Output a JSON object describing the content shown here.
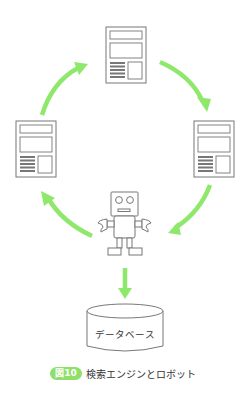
{
  "colors": {
    "arrow": "#8ee86b",
    "stroke": "#777777",
    "badge_bg": "#8ee06b",
    "text": "#333333"
  },
  "nodes": {
    "pages": [
      {
        "id": "page-top",
        "label": "Web page (top)"
      },
      {
        "id": "page-right",
        "label": "Web page (right)"
      },
      {
        "id": "page-left",
        "label": "Web page (left)"
      }
    ],
    "robot": {
      "label": "crawler robot"
    },
    "database": {
      "label": "データベース"
    }
  },
  "edges": [
    {
      "from": "page-top",
      "to": "page-right"
    },
    {
      "from": "page-right",
      "to": "robot"
    },
    {
      "from": "robot",
      "to": "page-left"
    },
    {
      "from": "page-left",
      "to": "page-top"
    },
    {
      "from": "robot",
      "to": "database"
    }
  ],
  "caption": {
    "badge": "図10",
    "text": "検索エンジンとロボット"
  }
}
